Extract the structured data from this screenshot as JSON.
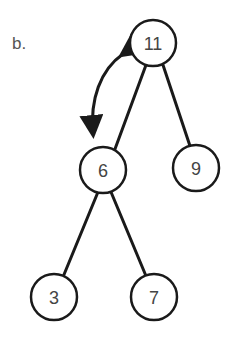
{
  "figure": {
    "label": "b.",
    "type": "binary-tree",
    "colors": {
      "stroke": "#1a1a1a",
      "text": "#444444",
      "background": "#ffffff"
    },
    "nodes": [
      {
        "id": "n11",
        "value": "11",
        "cx": 153,
        "cy": 43
      },
      {
        "id": "n6",
        "value": "6",
        "cx": 103,
        "cy": 170
      },
      {
        "id": "n9",
        "value": "9",
        "cx": 196,
        "cy": 168
      },
      {
        "id": "n3",
        "value": "3",
        "cx": 54,
        "cy": 297
      },
      {
        "id": "n7",
        "value": "7",
        "cx": 154,
        "cy": 297
      }
    ],
    "edges": [
      {
        "from": "11",
        "to": "6"
      },
      {
        "from": "11",
        "to": "9"
      },
      {
        "from": "6",
        "to": "3"
      },
      {
        "from": "6",
        "to": "7"
      }
    ],
    "annotations": [
      {
        "type": "double-headed-curved-arrow",
        "between": [
          "11",
          "6"
        ],
        "meaning": "swap"
      }
    ]
  }
}
